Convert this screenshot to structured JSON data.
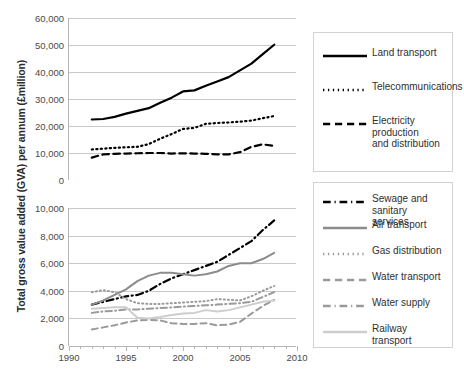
{
  "chart_data": {
    "type": "line",
    "title": "",
    "xlabel": "",
    "ylabel": "Total gross value added (GVA) per annum (£million)",
    "panels": [
      {
        "name": "upper-panel",
        "ylim": [
          0,
          60000
        ],
        "yticks": [
          "0",
          "10,000",
          "20,000",
          "30,000",
          "40,000",
          "50,000",
          "60,000"
        ],
        "ytick_values": [
          0,
          10000,
          20000,
          30000,
          40000,
          50000,
          60000
        ],
        "xlim": [
          1990,
          2010
        ],
        "xticks": [
          "1990",
          "1995",
          "2000",
          "2005",
          "2010"
        ],
        "grid": true,
        "series": [
          {
            "name": "Land transport",
            "style": "solid",
            "color": "#000000",
            "width": 2.2,
            "x": [
              1992,
              1993,
              1994,
              1995,
              1996,
              1997,
              1998,
              1999,
              2000,
              2001,
              2002,
              2003,
              2004,
              2005,
              2006,
              2007,
              2008
            ],
            "values": [
              22400,
              22600,
              23400,
              24600,
              25600,
              26600,
              28600,
              30500,
              32800,
              33200,
              34900,
              36500,
              38100,
              40600,
              43100,
              46600,
              50100
            ]
          },
          {
            "name": "Telecommunications",
            "style": "dotted",
            "color": "#000000",
            "width": 2.2,
            "x": [
              1992,
              1993,
              1994,
              1995,
              1996,
              1997,
              1998,
              1999,
              2000,
              2001,
              2002,
              2003,
              2004,
              2005,
              2006,
              2007,
              2008
            ],
            "values": [
              11300,
              11600,
              11900,
              12100,
              12300,
              13300,
              15300,
              17000,
              18900,
              19300,
              20800,
              21100,
              21300,
              21600,
              22000,
              22900,
              23700
            ]
          },
          {
            "name": "Electricity production and distribution",
            "style": "dashed",
            "color": "#000000",
            "width": 2.2,
            "x": [
              1992,
              1993,
              1994,
              1995,
              1996,
              1997,
              1998,
              1999,
              2000,
              2001,
              2002,
              2003,
              2004,
              2005,
              2006,
              2007,
              2008
            ],
            "values": [
              8300,
              9500,
              9700,
              9800,
              9900,
              10000,
              10000,
              9800,
              9900,
              9800,
              9700,
              9500,
              9500,
              10300,
              12300,
              13200,
              12600
            ]
          }
        ]
      },
      {
        "name": "lower-panel",
        "ylim": [
          0,
          10000
        ],
        "yticks": [
          "0",
          "2,000",
          "4,000",
          "6,000",
          "8,000",
          "10,000"
        ],
        "ytick_values": [
          0,
          2000,
          4000,
          6000,
          8000,
          10000
        ],
        "xlim": [
          1990,
          2010
        ],
        "xticks": [
          "1990",
          "1995",
          "2000",
          "2005",
          "2010"
        ],
        "grid": true,
        "series": [
          {
            "name": "Sewage and sanitary services",
            "style": "dash-dot",
            "color": "#000000",
            "width": 2.2,
            "x": [
              1992,
              1993,
              1994,
              1995,
              1996,
              1997,
              1998,
              1999,
              2000,
              2001,
              2002,
              2003,
              2004,
              2005,
              2006,
              2007,
              2008
            ],
            "values": [
              3000,
              3200,
              3400,
              3600,
              3700,
              4000,
              4500,
              4900,
              5200,
              5500,
              5800,
              6100,
              6600,
              7100,
              7600,
              8400,
              9100
            ]
          },
          {
            "name": "Air transport",
            "style": "solid",
            "color": "#8c8c8c",
            "width": 2.0,
            "x": [
              1992,
              1993,
              1994,
              1995,
              1996,
              1997,
              1998,
              1999,
              2000,
              2001,
              2002,
              2003,
              2004,
              2005,
              2006,
              2007,
              2008
            ],
            "values": [
              3000,
              3300,
              3700,
              4100,
              4700,
              5100,
              5300,
              5300,
              5200,
              5100,
              5200,
              5400,
              5800,
              6000,
              6000,
              6300,
              6750
            ]
          },
          {
            "name": "Gas distribution",
            "style": "dotted",
            "color": "#9a9a9a",
            "width": 2.0,
            "x": [
              1992,
              1993,
              1994,
              1995,
              1996,
              1997,
              1998,
              1999,
              2000,
              2001,
              2002,
              2003,
              2004,
              2005,
              2006,
              2007,
              2008
            ],
            "values": [
              3900,
              4050,
              3900,
              3400,
              3100,
              3050,
              3050,
              3100,
              3150,
              3200,
              3250,
              3400,
              3350,
              3300,
              3600,
              4000,
              4350
            ]
          },
          {
            "name": "Water transport",
            "style": "dashed",
            "color": "#9a9a9a",
            "width": 2.0,
            "x": [
              1992,
              1993,
              1994,
              1995,
              1996,
              1997,
              1998,
              1999,
              2000,
              2001,
              2002,
              2003,
              2004,
              2005,
              2006,
              2007,
              2008
            ],
            "values": [
              1200,
              1350,
              1500,
              1700,
              1850,
              1900,
              1850,
              1650,
              1600,
              1600,
              1650,
              1500,
              1550,
              1750,
              2350,
              2900,
              3350
            ]
          },
          {
            "name": "Water supply",
            "style": "dash-dot",
            "color": "#9a9a9a",
            "width": 2.0,
            "x": [
              1992,
              1993,
              1994,
              1995,
              1996,
              1997,
              1998,
              1999,
              2000,
              2001,
              2002,
              2003,
              2004,
              2005,
              2006,
              2007,
              2008
            ],
            "values": [
              2400,
              2500,
              2550,
              2650,
              2650,
              2700,
              2750,
              2800,
              2850,
              2900,
              2950,
              3000,
              3050,
              3100,
              3200,
              3550,
              3900
            ]
          },
          {
            "name": "Railway transport",
            "style": "solid",
            "color": "#cdcdcd",
            "width": 2.0,
            "x": [
              1992,
              1993,
              1994,
              1995,
              1996,
              1997,
              1998,
              1999,
              2000,
              2001,
              2002,
              2003,
              2004,
              2005,
              2006,
              2007,
              2008
            ],
            "values": [
              2700,
              2750,
              2800,
              2800,
              2050,
              2000,
              2100,
              2250,
              2350,
              2400,
              2600,
              2500,
              2600,
              2800,
              3000,
              3200,
              3300
            ]
          }
        ]
      }
    ],
    "legends": [
      {
        "name": "upper-legend",
        "items": [
          {
            "label": "Land transport",
            "style": "solid",
            "color": "#000000"
          },
          {
            "label": "Telecommunications",
            "style": "dotted",
            "color": "#000000"
          },
          {
            "label": "Electricity production\nand distribution",
            "style": "dashed",
            "color": "#000000"
          }
        ]
      },
      {
        "name": "lower-legend",
        "items": [
          {
            "label": "Sewage and sanitary\nservices",
            "style": "dash-dot",
            "color": "#000000"
          },
          {
            "label": "Air transport",
            "style": "solid",
            "color": "#8c8c8c"
          },
          {
            "label": "Gas distribution",
            "style": "dotted",
            "color": "#9a9a9a"
          },
          {
            "label": "Water transport",
            "style": "dashed",
            "color": "#9a9a9a"
          },
          {
            "label": "Water supply",
            "style": "dash-dot",
            "color": "#9a9a9a"
          },
          {
            "label": "Railway transport",
            "style": "solid",
            "color": "#cdcdcd"
          }
        ]
      }
    ]
  }
}
